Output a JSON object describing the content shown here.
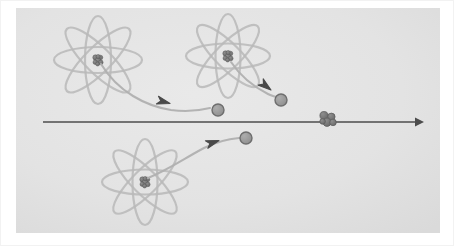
{
  "figure": {
    "width": 454,
    "height": 246,
    "caption": "",
    "colors": {
      "background": "#e4e4e4",
      "background_edge": "#dcdcdc",
      "page": "#ffffff",
      "border": "#f2f2f2",
      "orbit": "#b9b9b9",
      "trajectory": "#b0b0b0",
      "axis_arrow": "#4c4c4c",
      "particle_fill": "#9a9a9a",
      "particle_stroke": "#6e6e6e",
      "nucleus_fill": "#7d7d7d",
      "nucleus_stroke": "#5a5a5a",
      "arrowhead": "#4a4a4a"
    },
    "plate": {
      "x": 16,
      "y": 8,
      "width": 424,
      "height": 225
    },
    "axis": {
      "label": "beam-axis",
      "x1": 43,
      "y1": 122,
      "x2": 424,
      "y2": 122,
      "arrowhead_size": 9,
      "stroke_width": 1.6
    },
    "target_nucleus": {
      "label": "target-nucleus",
      "cx": 328,
      "cy": 119,
      "spheres": [
        {
          "cx": -4.0,
          "cy": -3.4,
          "r": 4.1
        },
        {
          "cx": 3.4,
          "cy": -2.2,
          "r": 3.7
        },
        {
          "cx": -1.0,
          "cy": 3.2,
          "r": 4.2
        },
        {
          "cx": 5.0,
          "cy": 3.4,
          "r": 3.3
        },
        {
          "cx": -5.4,
          "cy": 2.4,
          "r": 2.8
        }
      ]
    },
    "atoms": [
      {
        "label": "atom-upper-left",
        "cx": 98,
        "cy": 60,
        "rx": 44,
        "ry": 13,
        "angles": [
          0,
          45,
          90,
          135
        ],
        "nucleus_r": 7.5
      },
      {
        "label": "atom-upper-right",
        "cx": 228,
        "cy": 56,
        "rx": 42,
        "ry": 12.5,
        "angles": [
          0,
          45,
          90,
          135
        ],
        "nucleus_r": 7.0
      },
      {
        "label": "atom-lower-middle",
        "cx": 145,
        "cy": 182,
        "rx": 43,
        "ry": 12.5,
        "angles": [
          0,
          45,
          90,
          135
        ],
        "nucleus_r": 7.0
      }
    ],
    "trajectories": [
      {
        "label": "trajectory-upper-left",
        "path": "M 101 64 C 118 92 146 106 171 110 C 186 112 198 111 210 108",
        "arrowhead": {
          "x": 170,
          "y": 103.5,
          "angle": 15
        },
        "particle": {
          "cx": 218,
          "cy": 110,
          "r": 6.0
        }
      },
      {
        "label": "trajectory-upper-right",
        "path": "M 231 62 C 239 74 252 86 268 94 C 272 96 276 97 280 98",
        "arrowhead": {
          "x": 271,
          "y": 90,
          "angle": 38
        },
        "particle": {
          "cx": 281,
          "cy": 100,
          "r": 6.0
        }
      },
      {
        "label": "trajectory-lower-middle",
        "path": "M 148 178 C 168 170 185 158 204 148 C 218 141 228 139 239 138",
        "arrowhead": {
          "x": 219,
          "y": 140.5,
          "angle": -18
        },
        "particle": {
          "cx": 246,
          "cy": 138,
          "r": 6.0
        }
      }
    ]
  }
}
